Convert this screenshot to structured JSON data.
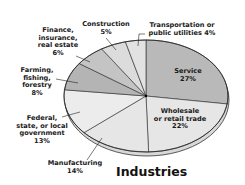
{
  "chart_data": {
    "type": "pie",
    "title": "Industries",
    "categories": [
      "Service",
      "Wholesale or retail trade",
      "Manufacturing",
      "Federal, state, or local government",
      "Farming, fishing, forestry",
      "Finance, insurance, real estate",
      "Construction",
      "Transportation or public utilities"
    ],
    "values": [
      27,
      22,
      14,
      13,
      8,
      6,
      5,
      4
    ],
    "unit": "%",
    "slices": [
      {
        "name": "Service",
        "value": 27,
        "label_lines": [
          "Service",
          "27%"
        ],
        "color": "#b9b9b9"
      },
      {
        "name": "Wholesale or retail trade",
        "value": 22,
        "label_lines": [
          "Wholesale",
          "or retail trade",
          "22%"
        ],
        "color": "#e6e6e6"
      },
      {
        "name": "Manufacturing",
        "value": 14,
        "label_lines": [
          "Manufacturing",
          "14%"
        ],
        "color": "#e6e6e6"
      },
      {
        "name": "Federal, state, or local government",
        "value": 13,
        "label_lines": [
          "Federal,",
          "state, or local",
          "government",
          "13%"
        ],
        "color": "#ececec"
      },
      {
        "name": "Farming, fishing, forestry",
        "value": 8,
        "label_lines": [
          "Farming,",
          "fishing,",
          "forestry",
          "8%"
        ],
        "color": "#b4b4b4"
      },
      {
        "name": "Finance, insurance, real estate",
        "value": 6,
        "label_lines": [
          "Finance,",
          "insurance,",
          "real estate",
          "6%"
        ],
        "color": "#c4c4c4"
      },
      {
        "name": "Construction",
        "value": 5,
        "label_lines": [
          "Construction",
          "5%"
        ],
        "color": "#dcdcdc"
      },
      {
        "name": "Transportation or public utilities",
        "value": 4,
        "label_lines": [
          "Transportation or",
          "public utilities 4%"
        ],
        "color": "#e2e2e2"
      }
    ],
    "legend": "none (labels attached to slices)",
    "style": "3D tilted pie, grayscale"
  }
}
